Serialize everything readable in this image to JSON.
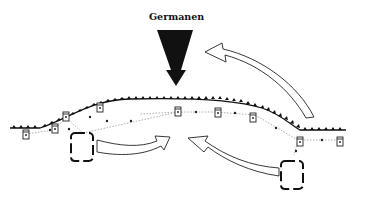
{
  "diagram": {
    "title_label": "Germanen",
    "colors": {
      "ink": "#111111",
      "dotted_path": "#999999",
      "background": "#ffffff"
    },
    "elements": {
      "invasion_arrow": "solid black arrow pointing down toward the frontier",
      "frontier_line": "palisade / limes line with small triangular ticks",
      "watchtowers": 7,
      "fort_groups": 2,
      "counter_arrows": 3
    }
  }
}
